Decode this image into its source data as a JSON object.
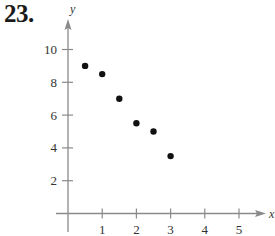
{
  "problem": {
    "number_label": "23."
  },
  "chart_data": {
    "type": "scatter",
    "title": "",
    "xlabel": "x",
    "ylabel": "y",
    "xlim": [
      0,
      5.5
    ],
    "ylim": [
      0,
      11.5
    ],
    "grid": false,
    "legend": null,
    "x_ticks": [
      1,
      2,
      3,
      4,
      5
    ],
    "x_tick_labels": [
      "1",
      "2",
      "3",
      "4",
      "5"
    ],
    "y_ticks": [
      2,
      4,
      6,
      8,
      10
    ],
    "y_tick_labels": [
      "2",
      "4",
      "6",
      "8",
      "10"
    ],
    "points": [
      {
        "x": 0.5,
        "y": 9.0
      },
      {
        "x": 1.0,
        "y": 8.5
      },
      {
        "x": 1.5,
        "y": 7.0
      },
      {
        "x": 2.0,
        "y": 5.5
      },
      {
        "x": 2.5,
        "y": 5.0
      },
      {
        "x": 3.0,
        "y": 3.5
      }
    ],
    "x": [
      0.5,
      1.0,
      1.5,
      2.0,
      2.5,
      3.0
    ],
    "y": [
      9.0,
      8.5,
      7.0,
      5.5,
      5.0,
      3.5
    ],
    "colors": {
      "axis": "#8a8a8a",
      "point": "#111111",
      "text": "#333333"
    }
  }
}
